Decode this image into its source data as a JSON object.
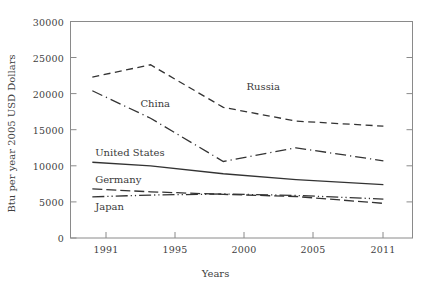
{
  "chart_data": {
    "type": "line",
    "title": "",
    "xlabel": "Years",
    "ylabel": "Btu per year 2005 USD Dollars",
    "x": [
      1991,
      1995,
      2000,
      2005,
      2011
    ],
    "xticklabels": [
      "1991",
      "1995",
      "2000",
      "2005",
      "2011"
    ],
    "yticklabels": [
      "0",
      "5000",
      "10000",
      "15000",
      "20000",
      "25000",
      "30000"
    ],
    "yticks": [
      0,
      5000,
      10000,
      15000,
      20000,
      25000,
      30000
    ],
    "xlim": [
      1989.5,
      2013.0
    ],
    "ylim": [
      0,
      30000
    ],
    "grid": false,
    "legend_position": "inline-annotations",
    "series": [
      {
        "name": "Russia",
        "style": "dashed",
        "values": [
          22300,
          24000,
          18100,
          16200,
          15500
        ],
        "label_x": 2001.6,
        "label_y": 21000
      },
      {
        "name": "China",
        "style": "dash-dot",
        "values": [
          20400,
          16600,
          10600,
          12500,
          10700
        ],
        "label_x": 1994.3,
        "label_y": 18600
      },
      {
        "name": "United States",
        "style": "solid",
        "values": [
          10500,
          10000,
          8900,
          8100,
          7400
        ],
        "label_x": 1991.2,
        "label_y": 11800
      },
      {
        "name": "Germany",
        "style": "long-dash",
        "values": [
          6800,
          6400,
          6050,
          5750,
          4800
        ],
        "label_x": 1991.2,
        "label_y": 8000
      },
      {
        "name": "Japan",
        "style": "dash-dot-dot",
        "values": [
          5700,
          5950,
          6100,
          5900,
          5400
        ],
        "label_x": 1991.2,
        "label_y": 4300
      }
    ]
  },
  "axes": {
    "x_title": "Years",
    "y_title": "Btu per year 2005 USD Dollars"
  },
  "colors": {
    "line": "#333333",
    "axis": "#808080",
    "text": "#3a3a3a",
    "background": "#ffffff"
  }
}
